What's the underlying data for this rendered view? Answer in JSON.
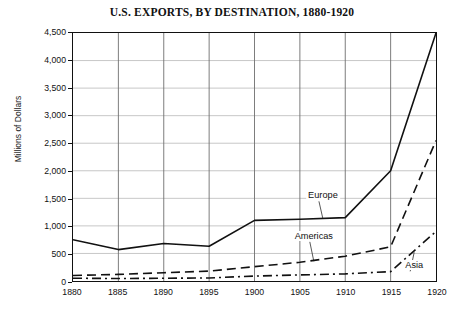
{
  "chart_data": {
    "type": "line",
    "title": "U.S. EXPORTS, BY DESTINATION, 1880-1920",
    "xlabel": "",
    "ylabel": "Millions of Dollars",
    "x": [
      1880,
      1885,
      1890,
      1895,
      1900,
      1905,
      1910,
      1915,
      1920
    ],
    "xticklabels": [
      "1880",
      "1885",
      "1890",
      "1895",
      "1900",
      "1905",
      "1910",
      "1915",
      "1920"
    ],
    "xlim": [
      1880,
      1920
    ],
    "ylim": [
      0,
      4500
    ],
    "yticks": [
      0,
      500,
      1000,
      1500,
      2000,
      2500,
      3000,
      3500,
      4000,
      4500
    ],
    "yticklabels": [
      "0",
      "500",
      "1,000",
      "1,500",
      "2,000",
      "2,500",
      "3,000",
      "3,500",
      "4,000",
      "4,500"
    ],
    "grid": true,
    "legend_position": "inline-annotations",
    "series": [
      {
        "name": "Europe",
        "style": "solid",
        "color": "#111111",
        "values": [
          750,
          570,
          680,
          630,
          1100,
          1120,
          1150,
          2000,
          4500
        ],
        "label_x": 1907.5,
        "label_y": 1560
      },
      {
        "name": "Americas",
        "style": "dashed",
        "color": "#111111",
        "values": [
          100,
          120,
          150,
          180,
          260,
          340,
          450,
          620,
          2550
        ],
        "label_x": 1906.5,
        "label_y": 830
      },
      {
        "name": "Asia",
        "style": "dashdot",
        "color": "#111111",
        "values": [
          50,
          45,
          50,
          55,
          90,
          110,
          130,
          170,
          900
        ],
        "label_x": 1917.5,
        "label_y": 300
      }
    ]
  },
  "axis": {
    "yticklabels": [
      "4,500",
      "4,000",
      "3,500",
      "3,000",
      "2,500",
      "2,000",
      "1,500",
      "1,000",
      "500",
      "0"
    ],
    "xticklabels": [
      "1880",
      "1885",
      "1890",
      "1895",
      "1900",
      "1905",
      "1910",
      "1915",
      "1920"
    ],
    "ylabel": "Millions of Dollars"
  },
  "labels": {
    "europe": "Europe",
    "americas": "Americas",
    "asia": "Asia"
  }
}
